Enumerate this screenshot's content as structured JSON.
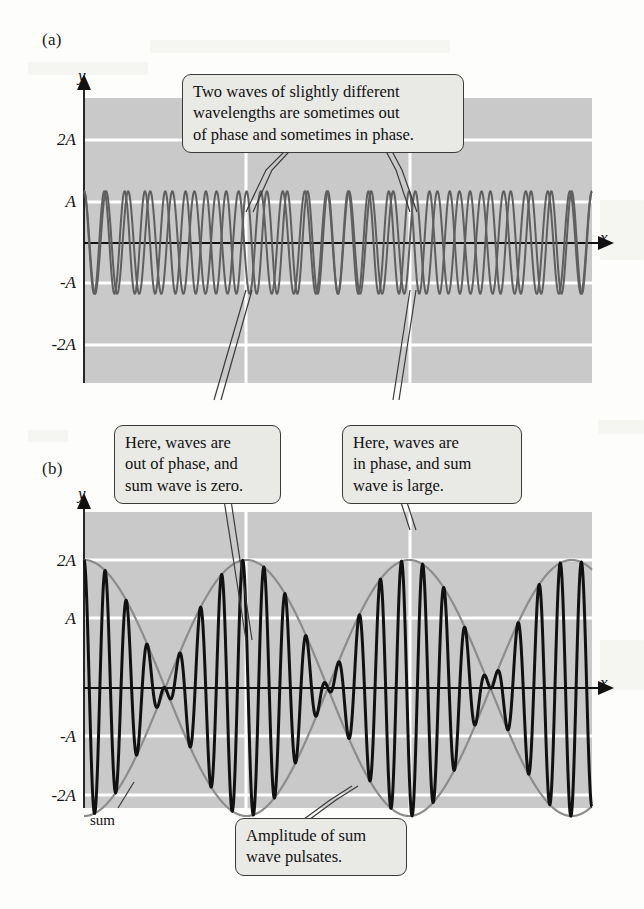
{
  "figure": {
    "panels": [
      {
        "id": "a",
        "label": "(a)",
        "y_axis_letter": "y",
        "x_axis_letter": "x",
        "y_ticks": [
          "2A",
          "A",
          "-A",
          "-2A"
        ],
        "points": [
          {
            "name": "P",
            "label": "P"
          },
          {
            "name": "R",
            "label": "R"
          }
        ]
      },
      {
        "id": "b",
        "label": "(b)",
        "y_axis_letter": "y",
        "x_axis_letter": "x",
        "y_ticks": [
          "2A",
          "A",
          "-A",
          "-2A"
        ],
        "points": [
          {
            "name": "P",
            "label": "P"
          },
          {
            "name": "R",
            "label": "R"
          }
        ],
        "curve_label": "sum"
      }
    ],
    "callouts": [
      {
        "name": "two-waves-callout",
        "lines": [
          "Two waves of slightly different",
          "wavelengths are sometimes out",
          "of phase and sometimes in phase."
        ]
      },
      {
        "name": "out-of-phase-callout",
        "lines": [
          "Here, waves are",
          "out of phase, and",
          "sum wave is zero."
        ]
      },
      {
        "name": "in-phase-callout",
        "lines": [
          "Here, waves are",
          "in phase, and sum",
          "wave is large."
        ]
      },
      {
        "name": "pulsate-callout",
        "lines": [
          "Amplitude of sum",
          "wave pulsates."
        ]
      }
    ]
  },
  "chart_data": {
    "type": "line",
    "title": "",
    "panels": [
      {
        "id": "a",
        "xlabel": "x",
        "ylabel": "y",
        "ylim": [
          -2.6,
          2.6
        ],
        "yticks": [
          2,
          1,
          -1,
          -2
        ],
        "ytick_labels": [
          "2A",
          "A",
          "-A",
          "-2A"
        ],
        "grid": "horizontal-and-vertical-white",
        "series": [
          {
            "name": "wave 1",
            "type": "sine",
            "amplitude": 1,
            "cycles": 23.0,
            "phase": 0,
            "color": "#6b6b6b"
          },
          {
            "name": "wave 2",
            "type": "sine",
            "amplitude": 1,
            "cycles": 25.0,
            "phase": 0,
            "color": "#6b6b6b"
          }
        ],
        "annotations": [
          {
            "label": "P",
            "x_frac": 0.32,
            "meaning": "out of phase"
          },
          {
            "label": "R",
            "x_frac": 0.64,
            "meaning": "in phase"
          }
        ]
      },
      {
        "id": "b",
        "xlabel": "x",
        "ylabel": "y",
        "ylim": [
          -2.6,
          2.6
        ],
        "yticks": [
          2,
          1,
          -1,
          -2
        ],
        "ytick_labels": [
          "2A",
          "A",
          "-A",
          "-2A"
        ],
        "grid": "horizontal-and-vertical-white",
        "series": [
          {
            "name": "sum",
            "type": "beat",
            "amplitude": 2,
            "carrier_cycles": 24.0,
            "envelope_cycles": 1.0,
            "color": "#111111"
          },
          {
            "name": "envelope",
            "type": "envelope",
            "amplitude": 2,
            "cycles": 1.0,
            "color": "#8c8c8c"
          }
        ],
        "annotations": [
          {
            "label": "P",
            "x_frac": 0.32,
            "meaning": "node, sum wave zero"
          },
          {
            "label": "R",
            "x_frac": 0.64,
            "meaning": "antinode, sum wave large"
          },
          {
            "label": "sum",
            "x_frac": 0.07,
            "meaning": "curve name"
          }
        ]
      }
    ]
  }
}
